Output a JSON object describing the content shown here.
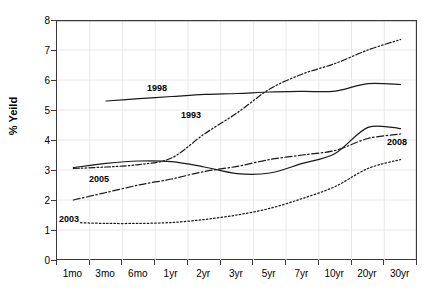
{
  "chart_data": {
    "type": "line",
    "title": "",
    "xlabel": "",
    "ylabel": "% Yeild",
    "ylim": [
      0,
      8
    ],
    "yticks": [
      0,
      1,
      2,
      3,
      4,
      5,
      6,
      7,
      8
    ],
    "grid": true,
    "legend_position": "inline-labels",
    "categories": [
      "1mo",
      "3mo",
      "6mo",
      "1yr",
      "2yr",
      "3yr",
      "5yr",
      "7yr",
      "10yr",
      "20yr",
      "30yr"
    ],
    "series": [
      {
        "name": "1998",
        "style": "solid",
        "label_text": "1998",
        "values": [
          null,
          5.3,
          5.38,
          5.45,
          5.52,
          5.55,
          5.6,
          5.62,
          5.63,
          5.88,
          5.85
        ]
      },
      {
        "name": "1993",
        "style": "dash-dot-dot",
        "label_text": "1993",
        "values": [
          3.05,
          3.1,
          3.18,
          3.4,
          4.2,
          4.9,
          5.7,
          6.2,
          6.55,
          7.0,
          7.35
        ]
      },
      {
        "name": "2005",
        "style": "dash-dot",
        "label_text": "2005",
        "values": [
          2.0,
          2.25,
          2.5,
          2.7,
          2.95,
          3.12,
          3.35,
          3.5,
          3.65,
          4.05,
          4.2
        ]
      },
      {
        "name": "2008",
        "style": "solid",
        "label_text": "2008",
        "values": [
          3.08,
          3.22,
          3.3,
          3.28,
          3.1,
          2.88,
          2.9,
          3.22,
          3.55,
          4.42,
          4.38
        ]
      },
      {
        "name": "2003",
        "style": "dotted",
        "label_text": "2003",
        "values": [
          1.25,
          1.22,
          1.22,
          1.25,
          1.35,
          1.5,
          1.72,
          2.05,
          2.45,
          3.05,
          3.35
        ]
      }
    ],
    "series_label_positions": [
      {
        "name": "1998",
        "x": 146,
        "y": 83
      },
      {
        "name": "1993",
        "x": 180,
        "y": 110
      },
      {
        "name": "2005",
        "x": 88,
        "y": 174
      },
      {
        "name": "2003",
        "x": 58,
        "y": 214
      },
      {
        "name": "2008",
        "x": 386,
        "y": 137
      }
    ]
  },
  "colors": {
    "axis": "#3a3a3a",
    "line": "#1a1a1a",
    "grid": "#e8e8ec",
    "background": "#ffffff"
  }
}
